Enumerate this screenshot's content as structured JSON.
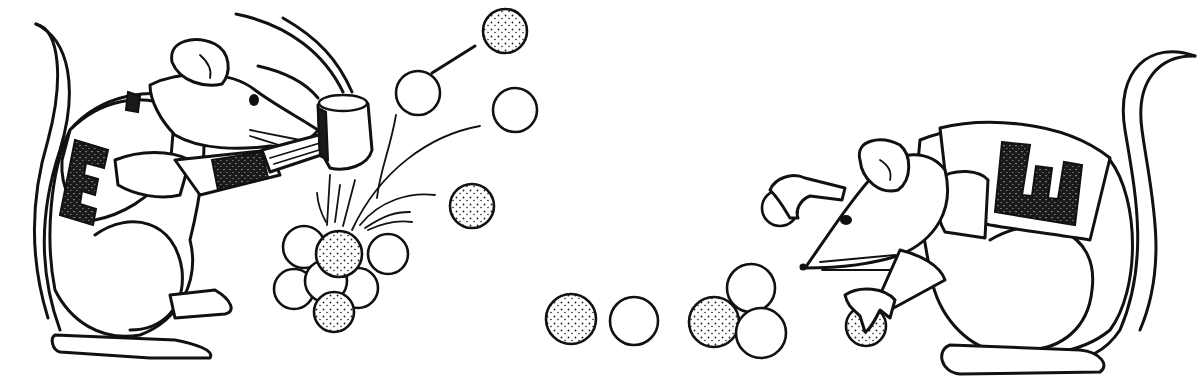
{
  "scene": {
    "description": "Line-art illustration of two mice wearing jerseys with the letter E, playing a ball game",
    "jersey_letter": "E",
    "ink_color": "#111111",
    "background_color": "#ffffff"
  },
  "left_mouse": {
    "pose": "swinging a wooden mallet",
    "jersey_letter": "E"
  },
  "right_mouse": {
    "pose": "crouching, holding one ball in each hand",
    "jersey_letter": "E"
  },
  "balls": {
    "cluster_left": {
      "plain": 6,
      "stippled": 2
    },
    "flying": {
      "plain": 2,
      "stippled": 2
    },
    "floor_row": {
      "plain": 3,
      "stippled": 2
    },
    "held": {
      "plain": 1,
      "stippled": 1
    }
  }
}
